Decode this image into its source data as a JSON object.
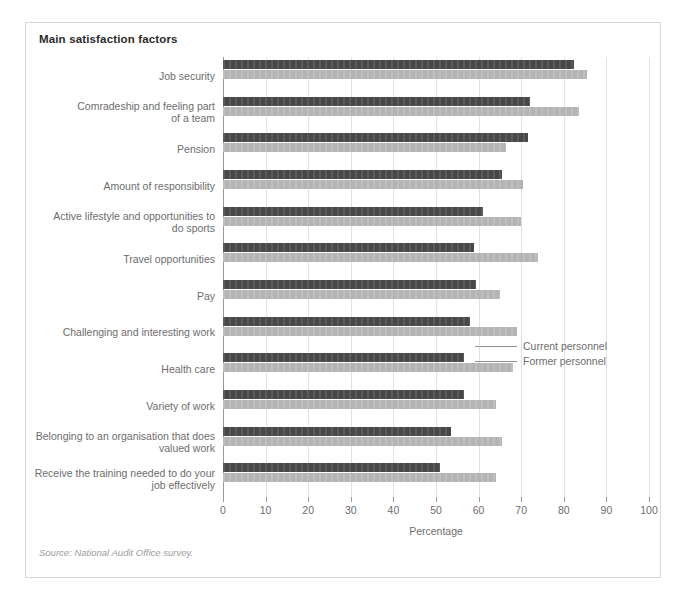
{
  "figure": {
    "title": "Main satisfaction factors",
    "source_note": "Source: National Audit Office survey.",
    "colors": {
      "current_personnel": "#484848",
      "former_personnel": "#b4b4b4",
      "frame": "#d8d8d8",
      "grid": "#e2e2e2",
      "text": "#6d6d6d"
    }
  },
  "legend": {
    "position": "inside-right-middle",
    "entries": [
      {
        "label": "Current personnel",
        "color": "#484848"
      },
      {
        "label": "Former personnel",
        "color": "#b4b4b4"
      }
    ]
  },
  "chart_data": {
    "type": "bar",
    "orientation": "horizontal",
    "title": "Main satisfaction factors",
    "xlabel": "Percentage",
    "ylabel": "",
    "xlim": [
      0,
      100
    ],
    "xticks": [
      0,
      10,
      20,
      30,
      40,
      50,
      60,
      70,
      80,
      90,
      100
    ],
    "xtick_labels": [
      "0",
      "10",
      "20",
      "30",
      "40",
      "50",
      "60",
      "70",
      "80",
      "90",
      "100"
    ],
    "grid": "vertical",
    "legend_position": "center-right",
    "categories": [
      "Job security",
      "Comradeship and feeling part\nof a team",
      "Pension",
      "Amount of responsibility",
      "Active lifestyle and opportunities to\ndo sports",
      "Travel opportunities",
      "Pay",
      "Challenging and interesting work",
      "Health care",
      "Variety of work",
      "Belonging to an organisation that does\nvalued work",
      "Receive the training needed to do your\njob effectively"
    ],
    "series": [
      {
        "name": "Current personnel",
        "color": "#484848",
        "values": [
          82.5,
          72,
          71.5,
          65.5,
          61,
          59,
          59.5,
          58,
          56.5,
          56.5,
          53.5,
          51
        ]
      },
      {
        "name": "Former personnel",
        "color": "#b4b4b4",
        "values": [
          85.5,
          83.5,
          66.5,
          70.5,
          70,
          74,
          65,
          69,
          68,
          64,
          65.5,
          64
        ]
      }
    ],
    "annotations": [
      "Source: National Audit Office survey."
    ]
  }
}
